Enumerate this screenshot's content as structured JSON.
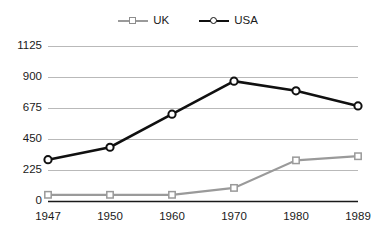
{
  "chart_data": {
    "type": "line",
    "title": "",
    "xlabel": "",
    "ylabel": "",
    "categories": [
      "1947",
      "1950",
      "1960",
      "1970",
      "1980",
      "1989"
    ],
    "series": [
      {
        "name": "UK",
        "color": "#9a9a9a",
        "marker": "square",
        "values": [
          45,
          45,
          45,
          95,
          295,
          325
        ]
      },
      {
        "name": "USA",
        "color": "#101010",
        "marker": "circle",
        "values": [
          300,
          390,
          630,
          870,
          800,
          690
        ]
      }
    ],
    "ylim": [
      0,
      1125
    ],
    "yticks": [
      0,
      225,
      450,
      675,
      900,
      1125
    ],
    "ytick_labels": [
      "0",
      "225",
      "450",
      "675",
      "900",
      "1125"
    ],
    "grid": true,
    "grid_color": "#b9b9b9",
    "axis_color": "#1a1a1a",
    "legend_position": "top-center"
  },
  "legend": {
    "entries": [
      {
        "label": "UK",
        "swatch": "gray-line-square-marker-icon"
      },
      {
        "label": "USA",
        "swatch": "black-line-circle-marker-icon"
      }
    ]
  },
  "clipped_title": ""
}
